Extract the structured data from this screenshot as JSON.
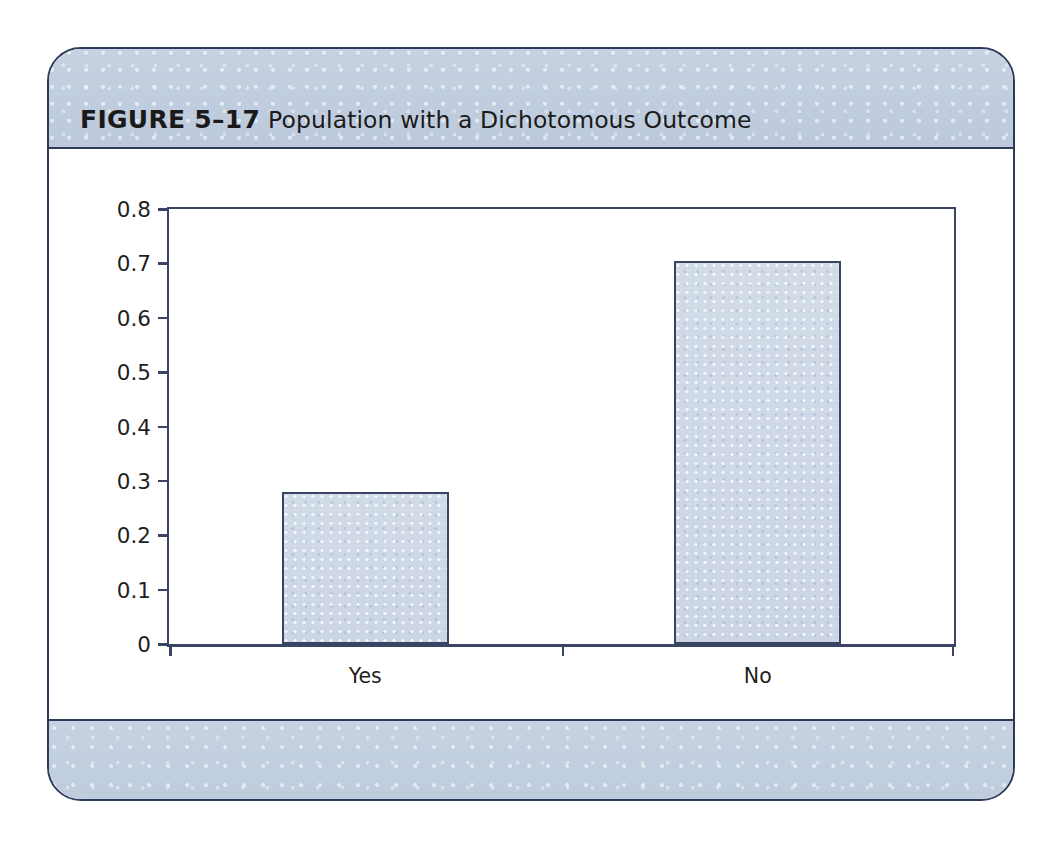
{
  "figure": {
    "label": "FIGURE 5–17",
    "title": "Population with a Dichotomous Outcome",
    "frame_border_color": "#2d3a59",
    "band_color": "#c2cfe0",
    "page_background": "#ffffff"
  },
  "chart_data": {
    "type": "bar",
    "title": "Population with a Dichotomous Outcome",
    "categories": [
      "Yes",
      "No"
    ],
    "values": [
      0.28,
      0.705
    ],
    "xlabel": "",
    "ylabel": "",
    "ylim": [
      0,
      0.8
    ],
    "yticks": [
      0,
      0.1,
      0.2,
      0.3,
      0.4,
      0.5,
      0.6,
      0.7,
      0.8
    ],
    "ytick_labels": [
      "0",
      "0.1",
      "0.2",
      "0.3",
      "0.4",
      "0.5",
      "0.6",
      "0.7",
      "0.8"
    ],
    "grid": false,
    "legend": null,
    "bar_fill_color": "#ced8e6",
    "bar_border_color": "#3a4463",
    "axis_color": "#3a4463",
    "plot_background": "#ffffff"
  }
}
